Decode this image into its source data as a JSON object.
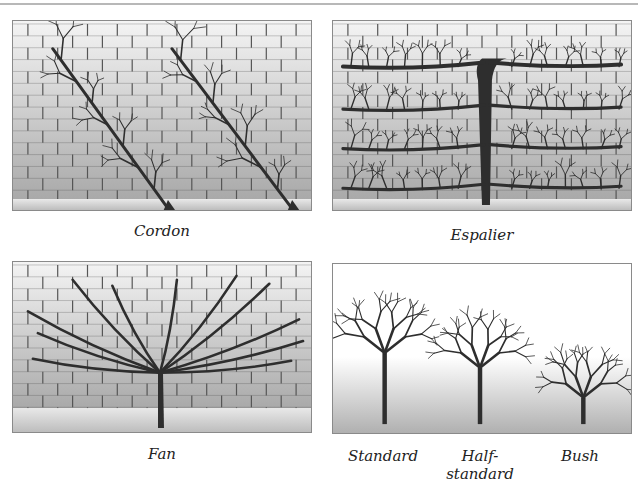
{
  "figure": {
    "panels": [
      {
        "id": "cordon",
        "caption": "Cordon",
        "background": "brick-wall"
      },
      {
        "id": "espalier",
        "caption": "Espalier",
        "background": "brick-wall"
      },
      {
        "id": "fan",
        "caption": "Fan",
        "background": "brick-wall"
      },
      {
        "id": "free-standing",
        "background": "open-ground",
        "trees": [
          {
            "caption_line1": "Standard",
            "caption_line2": ""
          },
          {
            "caption_line1": "Half-",
            "caption_line2": "standard"
          },
          {
            "caption_line1": "Bush",
            "caption_line2": ""
          }
        ]
      }
    ]
  },
  "colors": {
    "wood": "#2e2e2e",
    "mortar": "#555555",
    "brick_light": "#f4f4f4",
    "brick_dark": "#a9a9a9",
    "ground": "#bdbdbd"
  }
}
